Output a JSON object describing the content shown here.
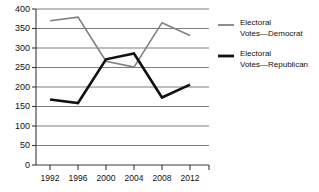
{
  "chart_data": {
    "type": "line",
    "title": "",
    "xlabel": "",
    "ylabel": "",
    "categories": [
      "1992",
      "1996",
      "2000",
      "2004",
      "2008",
      "2012"
    ],
    "xlim": [
      1992,
      2012
    ],
    "ylim": [
      0,
      400
    ],
    "ytick_values": [
      0,
      50,
      100,
      150,
      200,
      250,
      300,
      350,
      400
    ],
    "ytick_labels": [
      "0",
      "50",
      "100",
      "150",
      "200",
      "250",
      "300",
      "350",
      "400"
    ],
    "grid": true,
    "grid_axis": "y",
    "legend_position": "right",
    "series": [
      {
        "name": "Electoral Votes—Democrat",
        "name_line1": "Electoral",
        "name_line2": "Votes—Democrat",
        "color": "#808080",
        "width": 1.6,
        "values": [
          370,
          379,
          266,
          251,
          365,
          332
        ]
      },
      {
        "name": "Electoral Votes—Republican",
        "name_line1": "Electoral",
        "name_line2": "Votes—Republican",
        "color": "#111111",
        "width": 2.6,
        "values": [
          168,
          159,
          271,
          286,
          173,
          206
        ]
      }
    ]
  },
  "axes": {
    "axis_color": "#4a4a4a",
    "grid_color": "#6e6e6e",
    "text_color": "#111111"
  },
  "legend": {
    "items": [
      {
        "label_line1": "Electoral",
        "label_line2": "Votes—Democrat",
        "color": "#808080"
      },
      {
        "label_line1": "Electoral",
        "label_line2": "Votes—Republican",
        "color": "#111111"
      }
    ]
  }
}
